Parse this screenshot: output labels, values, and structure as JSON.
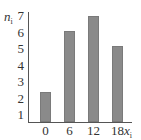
{
  "chart_data": {
    "type": "bar",
    "title": "",
    "xlabel": "x_i",
    "ylabel": "n_i",
    "categories": [
      "0",
      "6",
      "12",
      "18"
    ],
    "values": [
      2.4,
      6.1,
      7,
      5.2
    ],
    "yticks": [
      "1",
      "2",
      "3",
      "4",
      "5",
      "6",
      "7"
    ],
    "ylim": [
      0.5,
      7
    ],
    "grid": false,
    "legend": null,
    "bar_color": "#8a8a8a"
  },
  "labels": {
    "y_main": "n",
    "y_sub": "i",
    "x_main": "x",
    "x_sub": "i"
  }
}
